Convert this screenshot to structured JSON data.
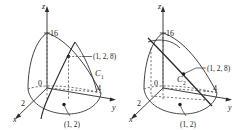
{
  "figure": {
    "title": "",
    "panels": [
      {
        "id": "left-panel",
        "curve_label": "C",
        "curve_subscript": "1",
        "axes": {
          "x": "x",
          "y": "y",
          "z": "z"
        },
        "origin_label": "0",
        "ticks": {
          "x": "2",
          "y": "4",
          "z": "16"
        },
        "point_space": "(1, 2, 8)",
        "point_plane": "(1, 2)"
      },
      {
        "id": "right-panel",
        "curve_label": "C",
        "curve_subscript": "2",
        "axes": {
          "x": "x",
          "y": "y",
          "z": "z"
        },
        "origin_label": "0",
        "ticks": {
          "x": "2",
          "y": "4",
          "z": "16"
        },
        "point_space": "(1, 2, 8)",
        "point_plane": "(1, 2)"
      }
    ],
    "colors": {
      "stroke": "#2b2b2b",
      "dashed": "#555555",
      "background": "#ffffff",
      "text": "#1a1a1a"
    }
  }
}
